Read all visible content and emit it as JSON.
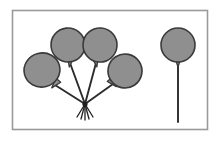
{
  "image": {
    "title": "Balloon bunch and single balloon illustration",
    "kind": "line-art-illustration",
    "width": 220,
    "height": 141,
    "background_color": "#ffffff"
  },
  "frame": {
    "name": "picture-border",
    "x": 12.5,
    "y": 10.5,
    "width": 195,
    "height": 119,
    "stroke_color": "#9a9a9a",
    "stroke_width": 1.6,
    "fill_color": "#ffffff"
  },
  "style": {
    "balloon_fill": "#8f8f8f",
    "balloon_stroke": "#3a3a3a",
    "balloon_stroke_width": 1.6,
    "string_color": "#2b2b2b",
    "string_width": 1.9,
    "knot_color": "#1f1f1f"
  },
  "groups": [
    {
      "name": "balloon-bunch",
      "label": "Bunch of four balloons",
      "count": 4,
      "knot": {
        "x": 85,
        "y": 104
      }
    },
    {
      "name": "single-balloon",
      "label": "Single balloon",
      "count": 1,
      "string_end": {
        "x": 178,
        "y": 122
      }
    }
  ],
  "balloons": [
    {
      "id": "balloon-bunch-left",
      "group": "balloon-bunch",
      "cx": 42,
      "cy": 70,
      "rx": 18,
      "ry": 17,
      "rotate": -14,
      "neck_x": 55,
      "neck_y": 84,
      "neck_rotate": 40
    },
    {
      "id": "balloon-bunch-upper-left",
      "group": "balloon-bunch",
      "cx": 68,
      "cy": 45,
      "rx": 17,
      "ry": 17,
      "rotate": -6,
      "neck_x": 70,
      "neck_y": 62,
      "neck_rotate": 8
    },
    {
      "id": "balloon-bunch-upper-right",
      "group": "balloon-bunch",
      "cx": 100,
      "cy": 45,
      "rx": 17,
      "ry": 17,
      "rotate": 5,
      "neck_x": 96,
      "neck_y": 62,
      "neck_rotate": -10
    },
    {
      "id": "balloon-bunch-right",
      "group": "balloon-bunch",
      "cx": 125,
      "cy": 71,
      "rx": 17,
      "ry": 17,
      "rotate": 12,
      "neck_x": 113,
      "neck_y": 83,
      "neck_rotate": -42
    },
    {
      "id": "balloon-single",
      "group": "single-balloon",
      "cx": 178,
      "cy": 45,
      "rx": 17,
      "ry": 17,
      "rotate": 0,
      "neck_x": 178,
      "neck_y": 62,
      "neck_rotate": 0
    }
  ],
  "strings": [
    {
      "id": "string-bunch-left",
      "from_x": 55,
      "from_y": 85,
      "to_x": 85,
      "to_y": 104
    },
    {
      "id": "string-bunch-upper-left",
      "from_x": 70,
      "from_y": 63,
      "to_x": 85,
      "to_y": 104
    },
    {
      "id": "string-bunch-upper-right",
      "from_x": 96,
      "from_y": 63,
      "to_x": 85,
      "to_y": 104
    },
    {
      "id": "string-bunch-right",
      "from_x": 113,
      "from_y": 84,
      "to_x": 85,
      "to_y": 104
    },
    {
      "id": "string-single",
      "from_x": 178,
      "from_y": 63,
      "to_x": 178,
      "to_y": 122
    }
  ],
  "tassel_strands": [
    {
      "id": "tassel-1",
      "to_x": 77,
      "to_y": 117
    },
    {
      "id": "tassel-2",
      "to_x": 81,
      "to_y": 119
    },
    {
      "id": "tassel-3",
      "to_x": 85,
      "to_y": 120
    },
    {
      "id": "tassel-4",
      "to_x": 89,
      "to_y": 119
    },
    {
      "id": "tassel-5",
      "to_x": 93,
      "to_y": 117
    }
  ]
}
